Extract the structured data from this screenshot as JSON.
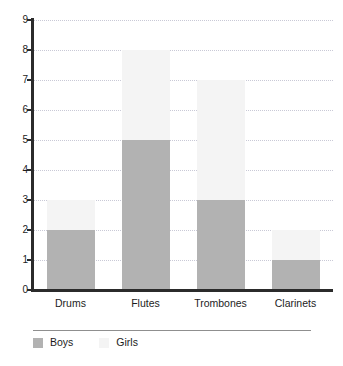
{
  "chart_data": {
    "type": "bar",
    "subtype": "stacked-bar",
    "title": "",
    "xlabel": "",
    "ylabel": "",
    "categories": [
      "Drums",
      "Flutes",
      "Trombones",
      "Clarinets"
    ],
    "series": [
      {
        "name": "Boys",
        "color": "#b2b2b2",
        "values": [
          2,
          5,
          3,
          1
        ]
      },
      {
        "name": "Girls",
        "color": "#f4f4f4",
        "values": [
          1,
          3,
          4,
          1
        ]
      }
    ],
    "totals": [
      3,
      8,
      7,
      2
    ],
    "ylim": [
      0,
      9
    ],
    "y_ticks": [
      "0",
      "1",
      "2",
      "3",
      "4",
      "5",
      "6",
      "7",
      "8",
      "9"
    ],
    "grid": true,
    "grid_style": "dotted",
    "grid_color": "#c9c9d6",
    "axis_color": "#2b2b2b",
    "legend_position": "bottom-left",
    "background": "#ffffff"
  },
  "legend": {
    "items": [
      {
        "label": "Boys",
        "swatch": "legend-swatch-boys"
      },
      {
        "label": "Girls",
        "swatch": "legend-swatch-girls"
      }
    ]
  }
}
